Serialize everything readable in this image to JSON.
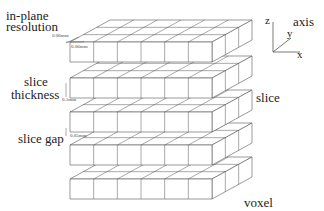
{
  "figure": {
    "labels": {
      "in_plane_line1": "in-plane",
      "in_plane_line2": "resolution",
      "in_plane_dim_depth": "0.06mm",
      "in_plane_dim_width": "0.06mm",
      "slice_thickness_line1": "slice",
      "slice_thickness_line2": "thickness",
      "slice_thickness_dim": "0.1mm",
      "slice_gap": "slice gap",
      "slice_gap_dim": "0.05mm",
      "slice": "slice",
      "voxel": "voxel",
      "axis_title": "axis",
      "axis_z": "z",
      "axis_y": "y",
      "axis_x": "x"
    },
    "grid": {
      "slabs": 5,
      "columns": 6,
      "depth_rows": 3
    },
    "colors": {
      "line": "#555555",
      "face": "#ffffff",
      "text": "#222222"
    }
  }
}
